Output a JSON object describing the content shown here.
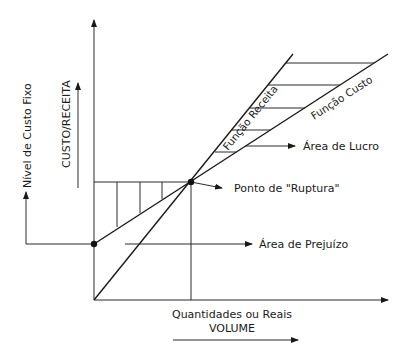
{
  "diagram": {
    "type": "break-even chart",
    "labels": {
      "y_axis_outer": "Nível de Custo Fixo",
      "y_axis_inner": "CUSTO/RECEITA",
      "x_axis_top": "Quantidades ou Reais",
      "x_axis_bottom": "VOLUME",
      "revenue_line": "Função Receita",
      "cost_line": "Função Custo",
      "profit_area": "Área de Lucro",
      "breakeven_point": "Ponto de \"Ruptura\"",
      "loss_area": "Área de Prejuízo"
    },
    "colors": {
      "line": "#1a1a1a",
      "background": "#ffffff"
    }
  }
}
